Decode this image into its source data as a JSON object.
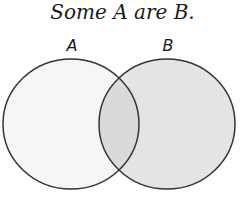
{
  "title": "Some A are B.",
  "sets": [
    {
      "label": "A",
      "fill": "#f6f6f6"
    },
    {
      "label": "B",
      "fill": "#e4e4e4"
    }
  ],
  "intersection_fill": "#dadada",
  "stroke": "#333333"
}
